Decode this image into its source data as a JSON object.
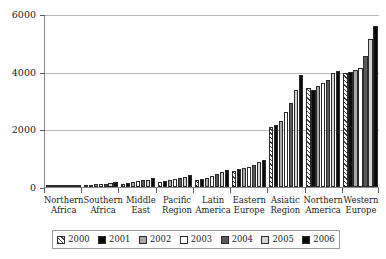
{
  "chart_data": {
    "type": "bar",
    "title": "",
    "subtitle": "",
    "xlabel": "",
    "ylabel": "",
    "ylim": [
      0,
      6000
    ],
    "y_ticks": [
      0,
      2000,
      4000,
      6000
    ],
    "y_tick_labels": [
      "0",
      "2000",
      "4000",
      "6000"
    ],
    "grid": true,
    "legend_position": "bottom",
    "categories": [
      "Northern Africa",
      "Southern Africa",
      "Middle East",
      "Pacific Region",
      "Latin America",
      "Eastern Europe",
      "Asiatic Region",
      "Northern America",
      "Western Europe"
    ],
    "category_lines": [
      [
        "Northern",
        "Africa"
      ],
      [
        "Southern",
        "Africa"
      ],
      [
        "Middle",
        "East"
      ],
      [
        "Pacific",
        "Region"
      ],
      [
        "Latin",
        "America"
      ],
      [
        "Eastern",
        "Europe"
      ],
      [
        "Asiatic",
        "Region"
      ],
      [
        "Northern",
        "America"
      ],
      [
        "Western",
        "Europe"
      ]
    ],
    "series": [
      {
        "name": "2000",
        "fill": "diagonal-hatch",
        "color": "#ffffff",
        "values": [
          30,
          70,
          120,
          180,
          250,
          560,
          2090,
          3450,
          3960
        ]
      },
      {
        "name": "2001",
        "fill": "solid",
        "color": "#0b0b0b",
        "values": [
          35,
          80,
          140,
          200,
          290,
          620,
          2140,
          3380,
          3980
        ]
      },
      {
        "name": "2002",
        "fill": "solid",
        "color": "#a8a8a8",
        "values": [
          40,
          90,
          170,
          230,
          330,
          660,
          2300,
          3500,
          4050
        ]
      },
      {
        "name": "2003",
        "fill": "solid",
        "color": "#ffffff",
        "values": [
          45,
          100,
          200,
          270,
          390,
          700,
          2600,
          3620,
          4120
        ]
      },
      {
        "name": "2004",
        "fill": "solid",
        "color": "#5a5a5a",
        "values": [
          55,
          120,
          230,
          310,
          450,
          780,
          2900,
          3700,
          4550
        ]
      },
      {
        "name": "2005",
        "fill": "solid",
        "color": "#d4d4d4",
        "values": [
          65,
          140,
          260,
          360,
          520,
          880,
          3350,
          3960,
          5150
        ]
      },
      {
        "name": "2006",
        "fill": "solid",
        "color": "#0b0b0b",
        "values": [
          75,
          160,
          300,
          410,
          590,
          940,
          3900,
          4010,
          5600
        ]
      }
    ]
  },
  "legend": {
    "items": [
      {
        "label": "2000"
      },
      {
        "label": "2001"
      },
      {
        "label": "2002"
      },
      {
        "label": "2003"
      },
      {
        "label": "2004"
      },
      {
        "label": "2005"
      },
      {
        "label": "2006"
      }
    ]
  }
}
